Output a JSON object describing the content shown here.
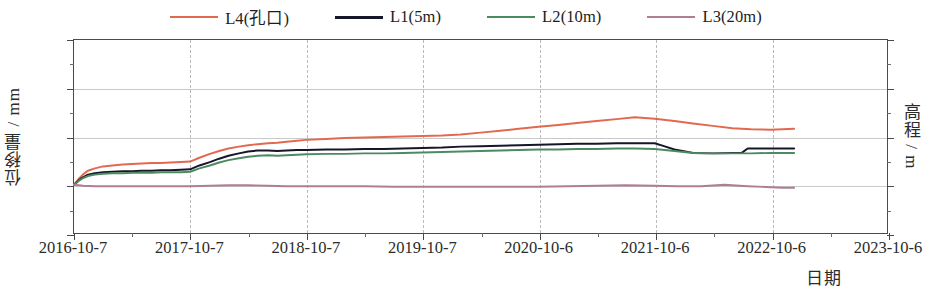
{
  "legend": {
    "items": [
      {
        "label": "L4(孔口)",
        "color": "#e2694f",
        "width": 2.0
      },
      {
        "label": "L1(5m)",
        "color": "#15162a",
        "width": 3.4
      },
      {
        "label": "L2(10m)",
        "color": "#4c8a62",
        "width": 2.0
      },
      {
        "label": "L3(20m)",
        "color": "#b07d95",
        "width": 2.0
      }
    ]
  },
  "axes": {
    "y_title": "位移量 / mm",
    "y_title_right": "高程 / m",
    "x_title": "日期",
    "y_ticks": [
      "30",
      "20",
      "10",
      "0",
      "-10"
    ],
    "y_tick_values": [
      30,
      20,
      10,
      0,
      -10
    ],
    "y_minor_values": [
      25,
      15,
      5,
      -5
    ],
    "x_ticks": [
      "2016-10-7",
      "2017-10-7",
      "2018-10-7",
      "2019-10-7",
      "2020-10-6",
      "2021-10-6",
      "2022-10-6",
      "2023-10-6"
    ]
  },
  "chart_data": {
    "type": "line",
    "title": "",
    "xlabel": "日期",
    "ylabel": "位移量 / mm",
    "ylabel_right": "高程 / m",
    "ylim": [
      -10,
      30
    ],
    "ytick_interval": 10,
    "yminor_interval": 5,
    "xlim": [
      "2016-10-7",
      "2023-10-6"
    ],
    "x_categories": [
      "2016-10-7",
      "2017-10-7",
      "2018-10-7",
      "2019-10-7",
      "2020-10-6",
      "2021-10-6",
      "2022-10-6",
      "2023-10-6"
    ],
    "grid": {
      "horizontal": true,
      "vertical": true,
      "vertical_style": "dashed",
      "horizontal_style": "solid"
    },
    "legend_position": "top",
    "data_end_x": "2022-12",
    "series": [
      {
        "name": "L4(孔口)",
        "color": "#e2694f",
        "x": [
          0.0,
          0.04,
          0.08,
          0.12,
          0.18,
          0.25,
          0.33,
          0.42,
          0.5,
          0.58,
          0.67,
          0.75,
          0.83,
          0.92,
          1.0,
          1.08,
          1.17,
          1.25,
          1.33,
          1.42,
          1.5,
          1.58,
          1.67,
          1.75,
          1.83,
          1.92,
          2.0,
          2.17,
          2.33,
          2.5,
          2.67,
          2.83,
          3.0,
          3.17,
          3.33,
          3.5,
          3.67,
          3.83,
          4.0,
          4.17,
          4.33,
          4.5,
          4.67,
          4.83,
          5.0,
          5.17,
          5.33,
          5.5,
          5.67,
          5.83,
          6.0,
          6.1,
          6.2
        ],
        "y": [
          0.0,
          1.2,
          2.2,
          2.9,
          3.4,
          3.8,
          4.0,
          4.2,
          4.3,
          4.4,
          4.5,
          4.5,
          4.6,
          4.7,
          4.8,
          5.6,
          6.4,
          7.0,
          7.5,
          7.9,
          8.2,
          8.4,
          8.6,
          8.7,
          8.9,
          9.1,
          9.3,
          9.5,
          9.7,
          9.8,
          9.9,
          10.0,
          10.1,
          10.2,
          10.4,
          10.8,
          11.2,
          11.6,
          12.0,
          12.4,
          12.8,
          13.2,
          13.6,
          14.0,
          13.7,
          13.2,
          12.7,
          12.2,
          11.7,
          11.5,
          11.4,
          11.5,
          11.6
        ]
      },
      {
        "name": "L1(5m)",
        "color": "#15162a",
        "x": [
          0.0,
          0.04,
          0.08,
          0.12,
          0.18,
          0.25,
          0.33,
          0.42,
          0.5,
          0.58,
          0.67,
          0.75,
          0.83,
          0.92,
          1.0,
          1.08,
          1.17,
          1.25,
          1.33,
          1.42,
          1.5,
          1.58,
          1.67,
          1.75,
          1.83,
          1.92,
          2.0,
          2.17,
          2.33,
          2.5,
          2.67,
          2.83,
          3.0,
          3.17,
          3.33,
          3.5,
          3.67,
          3.83,
          4.0,
          4.17,
          4.33,
          4.5,
          4.67,
          4.83,
          5.0,
          5.08,
          5.17,
          5.33,
          5.5,
          5.67,
          5.75,
          5.8,
          5.9,
          6.0,
          6.1,
          6.2
        ],
        "y": [
          0.0,
          0.9,
          1.6,
          2.1,
          2.4,
          2.6,
          2.7,
          2.8,
          2.8,
          2.9,
          2.9,
          3.0,
          3.0,
          3.1,
          3.2,
          4.0,
          4.7,
          5.4,
          6.0,
          6.5,
          6.9,
          7.1,
          7.1,
          7.0,
          7.1,
          7.2,
          7.2,
          7.3,
          7.3,
          7.4,
          7.4,
          7.5,
          7.6,
          7.7,
          7.9,
          8.0,
          8.1,
          8.2,
          8.3,
          8.4,
          8.5,
          8.5,
          8.6,
          8.6,
          8.6,
          8.0,
          7.3,
          6.6,
          6.5,
          6.6,
          6.6,
          7.5,
          7.5,
          7.5,
          7.5,
          7.5
        ]
      },
      {
        "name": "L2(10m)",
        "color": "#4c8a62",
        "x": [
          0.0,
          0.04,
          0.08,
          0.12,
          0.18,
          0.25,
          0.33,
          0.42,
          0.5,
          0.58,
          0.67,
          0.75,
          0.83,
          0.92,
          1.0,
          1.08,
          1.17,
          1.25,
          1.33,
          1.42,
          1.5,
          1.58,
          1.67,
          1.75,
          1.83,
          1.92,
          2.0,
          2.17,
          2.33,
          2.5,
          2.67,
          2.83,
          3.0,
          3.17,
          3.33,
          3.5,
          3.67,
          3.83,
          4.0,
          4.17,
          4.33,
          4.5,
          4.67,
          4.83,
          5.0,
          5.17,
          5.33,
          5.5,
          5.67,
          5.83,
          6.0,
          6.1,
          6.2
        ],
        "y": [
          0.0,
          0.8,
          1.4,
          1.8,
          2.1,
          2.3,
          2.4,
          2.4,
          2.5,
          2.5,
          2.5,
          2.6,
          2.6,
          2.6,
          2.7,
          3.4,
          4.0,
          4.6,
          5.1,
          5.5,
          5.8,
          6.0,
          6.1,
          6.0,
          6.1,
          6.2,
          6.3,
          6.4,
          6.4,
          6.5,
          6.5,
          6.6,
          6.7,
          6.8,
          6.9,
          7.0,
          7.1,
          7.2,
          7.3,
          7.3,
          7.4,
          7.4,
          7.5,
          7.5,
          7.4,
          7.0,
          6.6,
          6.5,
          6.5,
          6.5,
          6.6,
          6.6,
          6.6
        ]
      },
      {
        "name": "L3(20m)",
        "color": "#b07d95",
        "x": [
          0.0,
          0.08,
          0.18,
          0.33,
          0.5,
          0.67,
          0.83,
          1.0,
          1.17,
          1.33,
          1.5,
          1.67,
          1.83,
          2.0,
          2.25,
          2.5,
          2.75,
          3.0,
          3.25,
          3.5,
          3.75,
          4.0,
          4.25,
          4.5,
          4.75,
          5.0,
          5.2,
          5.4,
          5.6,
          5.8,
          6.0,
          6.1,
          6.2
        ],
        "y": [
          0.0,
          -0.2,
          -0.3,
          -0.3,
          -0.3,
          -0.3,
          -0.3,
          -0.3,
          -0.2,
          -0.1,
          -0.1,
          -0.2,
          -0.3,
          -0.3,
          -0.3,
          -0.3,
          -0.4,
          -0.4,
          -0.4,
          -0.4,
          -0.4,
          -0.4,
          -0.3,
          -0.2,
          -0.1,
          -0.2,
          -0.3,
          -0.3,
          0.0,
          -0.3,
          -0.5,
          -0.6,
          -0.6
        ]
      }
    ]
  }
}
